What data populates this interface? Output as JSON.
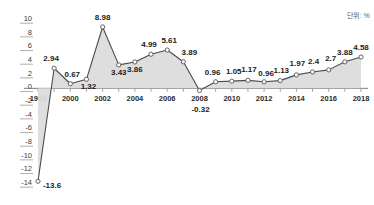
{
  "unit_note": "단위: %",
  "chart_data": {
    "type": "area",
    "title": "",
    "subtitle": "",
    "xlabel": "",
    "ylabel": "",
    "categories": [
      "1998",
      "1999",
      "2000",
      "2001",
      "2002",
      "2003",
      "2004",
      "2005",
      "2006",
      "2007",
      "2008",
      "2009",
      "2010",
      "2011",
      "2012",
      "2013",
      "2014",
      "2015",
      "2016",
      "2017",
      "2018"
    ],
    "values": [
      -13.6,
      2.94,
      0.67,
      1.32,
      8.98,
      3.43,
      3.86,
      4.99,
      5.61,
      3.89,
      -0.32,
      0.96,
      1.05,
      1.17,
      0.96,
      1.13,
      1.97,
      2.4,
      2.7,
      3.88,
      4.58
    ],
    "point_labels": [
      "-13.6",
      "2.94",
      "0.67",
      "1.32",
      "8.98",
      "3.43",
      "3.86",
      "4.99",
      "5.61",
      "3.89",
      "-0.32",
      "0.96",
      "1.05",
      "1.17",
      "0.96",
      "1.13",
      "1.97",
      "2.4",
      "2.7",
      "3.88",
      "4.58"
    ],
    "y_ticks": [
      10,
      8,
      6,
      4,
      2,
      0,
      -2,
      -4,
      -6,
      -8,
      -10,
      -12,
      -14
    ],
    "y_tick_labels": [
      "10",
      "8",
      "6",
      "4",
      "2",
      "0",
      "-2",
      "-4",
      "-6",
      "-8",
      "-10",
      "-12",
      "-14"
    ],
    "ylim": [
      -14,
      10
    ],
    "x_tick_labels": [
      "1998",
      "2000",
      "2002",
      "2004",
      "2006",
      "2008",
      "2010",
      "2012",
      "2014",
      "2016",
      "2018"
    ],
    "x_tick_years": [
      1998,
      2000,
      2002,
      2004,
      2006,
      2008,
      2010,
      2012,
      2014,
      2016,
      2018
    ],
    "grid": false,
    "legend": "none",
    "colors": {
      "area_fill": "#dcdcdc",
      "line": "#4a4a4a",
      "marker_fill": "#ffffff",
      "marker_stroke": "#555555",
      "axis": "#6f6f6f",
      "tick_text": "#3d3d3d",
      "value_text": "#1c1c1c",
      "unit_text": "#5a5a5a"
    },
    "label_offsets": {
      "-13.6": {
        "dx": 14,
        "dy": 7
      },
      "2.94": {
        "dx": -3,
        "dy": -7
      },
      "0.67": {
        "dx": 2,
        "dy": -7
      },
      "1.32": {
        "dx": 2,
        "dy": 10
      },
      "8.98": {
        "dx": 0,
        "dy": -7
      },
      "3.43": {
        "dx": 0,
        "dy": 10
      },
      "3.86": {
        "dx": 0,
        "dy": 10
      },
      "4.99": {
        "dx": -2,
        "dy": -7
      },
      "5.61": {
        "dx": 2,
        "dy": -7
      },
      "3.89": {
        "dx": 6,
        "dy": -7
      },
      "-0.32": {
        "dx": 1,
        "dy": 21
      },
      "0.96": {
        "dx": -3,
        "dy": -7
      },
      "1.05": {
        "dx": 2,
        "dy": -7
      },
      "1.17": {
        "dx": 1,
        "dy": -8
      },
      "0.96b": {
        "dx": 2,
        "dy": -6
      },
      "1.13": {
        "dx": 1,
        "dy": -8
      },
      "1.97": {
        "dx": 1,
        "dy": -9
      },
      "2.4": {
        "dx": 1,
        "dy": -8
      },
      "2.7": {
        "dx": 2,
        "dy": -9
      },
      "3.88": {
        "dx": 0,
        "dy": -7
      },
      "4.58": {
        "dx": 0,
        "dy": -7
      }
    }
  }
}
